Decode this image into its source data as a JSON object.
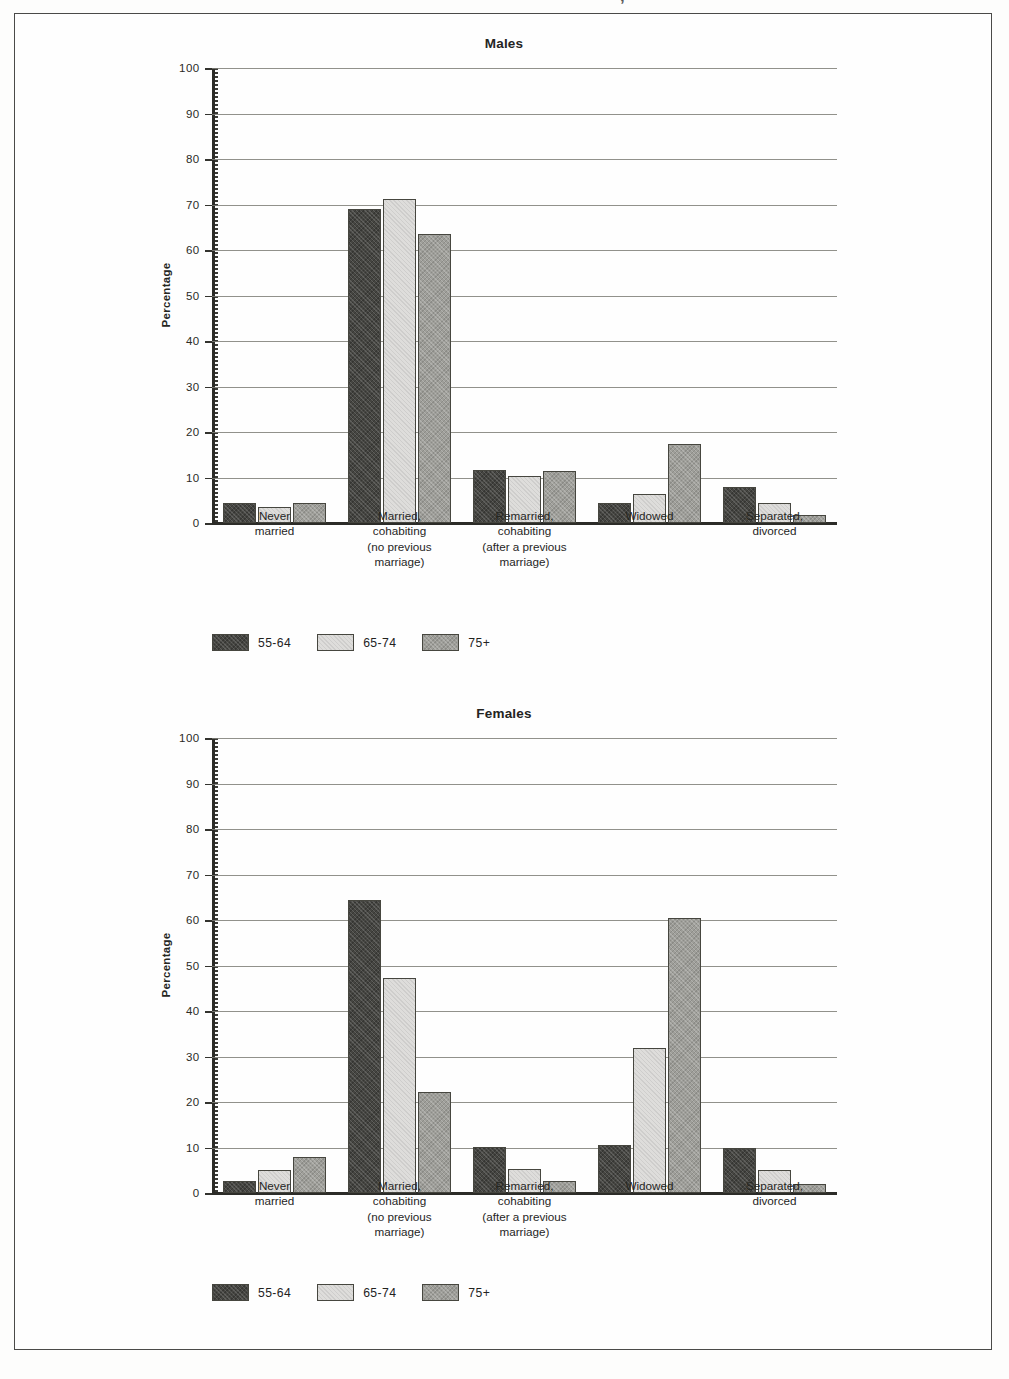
{
  "page": {
    "top_bleed_text": "’ ,,"
  },
  "series_labels": [
    "55-64",
    "65-74",
    "75+"
  ],
  "series_colors": [
    "#454541",
    "#dedddb",
    "#9e9e99"
  ],
  "categories": [
    "Never\nmarried",
    "Married,\ncohabiting\n(no previous\nmarriage)",
    "Remarried,\ncohabiting\n(after a previous\nmarriage)",
    "Widowed",
    "Separated,\ndivorced"
  ],
  "yticks": [
    "0",
    "10",
    "20",
    "30",
    "40",
    "50",
    "60",
    "70",
    "80",
    "90",
    "100"
  ],
  "ylabel": "Percentage",
  "charts": [
    {
      "id": "males",
      "title": "Males",
      "legend": [
        "55-64",
        "65-74",
        "75+"
      ]
    },
    {
      "id": "females",
      "title": "Females",
      "legend": [
        "55-64",
        "65-74",
        "75+"
      ]
    }
  ],
  "chart_data": [
    {
      "type": "bar",
      "title": "Males",
      "xlabel": "",
      "ylabel": "Percentage",
      "ylim": [
        0,
        100
      ],
      "ytick_step": 10,
      "grid": true,
      "legend_position": "bottom-left",
      "categories": [
        "Never married",
        "Married, cohabiting (no previous marriage)",
        "Remarried, cohabiting (after a previous marriage)",
        "Widowed",
        "Separated, divorced"
      ],
      "series": [
        {
          "name": "55-64",
          "values": [
            4.5,
            69.0,
            11.7,
            4.5,
            8.0
          ]
        },
        {
          "name": "65-74",
          "values": [
            3.6,
            71.2,
            10.3,
            6.3,
            4.3
          ]
        },
        {
          "name": "75+",
          "values": [
            4.5,
            63.5,
            11.5,
            17.3,
            1.8
          ]
        }
      ]
    },
    {
      "type": "bar",
      "title": "Females",
      "xlabel": "",
      "ylabel": "Percentage",
      "ylim": [
        0,
        100
      ],
      "ytick_step": 10,
      "grid": true,
      "legend_position": "bottom-left",
      "categories": [
        "Never married",
        "Married, cohabiting (no previous marriage)",
        "Remarried, cohabiting (after a previous marriage)",
        "Widowed",
        "Separated, divorced"
      ],
      "series": [
        {
          "name": "55-64",
          "values": [
            2.6,
            64.5,
            10.2,
            10.6,
            9.9
          ]
        },
        {
          "name": "65-74",
          "values": [
            5.0,
            47.3,
            5.3,
            31.9,
            5.0
          ]
        },
        {
          "name": "75+",
          "values": [
            8.0,
            22.2,
            2.7,
            60.5,
            2.0
          ]
        }
      ]
    }
  ]
}
